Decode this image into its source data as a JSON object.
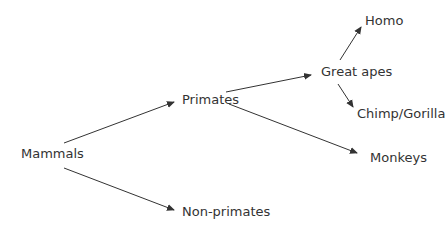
{
  "diagram": {
    "type": "tree",
    "colors": {
      "text": "#333333",
      "edge": "#333333",
      "background": "#ffffff"
    },
    "nodes": {
      "mammals": {
        "label": "Mammals",
        "x": 21,
        "y": 146
      },
      "primates": {
        "label": "Primates",
        "x": 182,
        "y": 92
      },
      "non_primates": {
        "label": "Non-primates",
        "x": 182,
        "y": 204
      },
      "great_apes": {
        "label": "Great apes",
        "x": 321,
        "y": 64
      },
      "monkeys": {
        "label": "Monkeys",
        "x": 370,
        "y": 150
      },
      "homo": {
        "label": "Homo",
        "x": 365,
        "y": 13
      },
      "chimp_gorilla": {
        "label": "Chimp/Gorilla",
        "x": 357,
        "y": 106
      }
    },
    "edges": [
      {
        "from": "mammals",
        "to": "primates",
        "x1": 64,
        "y1": 143,
        "x2": 174,
        "y2": 102
      },
      {
        "from": "mammals",
        "to": "non_primates",
        "x1": 64,
        "y1": 168,
        "x2": 174,
        "y2": 210
      },
      {
        "from": "primates",
        "to": "great_apes",
        "x1": 226,
        "y1": 92,
        "x2": 311,
        "y2": 75
      },
      {
        "from": "primates",
        "to": "monkeys",
        "x1": 229,
        "y1": 104,
        "x2": 357,
        "y2": 153
      },
      {
        "from": "great_apes",
        "to": "homo",
        "x1": 340,
        "y1": 60,
        "x2": 361,
        "y2": 27
      },
      {
        "from": "great_apes",
        "to": "chimp_gorilla",
        "x1": 338,
        "y1": 84,
        "x2": 353,
        "y2": 107
      }
    ]
  }
}
